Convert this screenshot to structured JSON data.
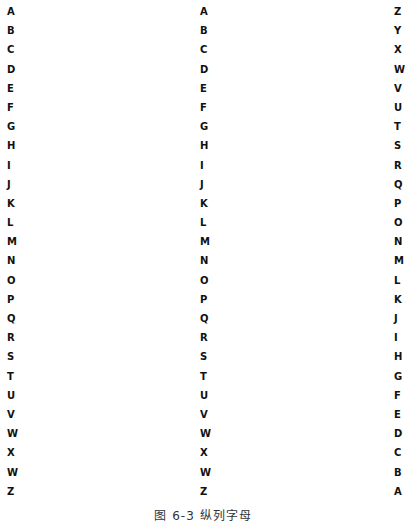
{
  "columns": {
    "left": [
      "A",
      "B",
      "C",
      "D",
      "E",
      "F",
      "G",
      "H",
      "I",
      "J",
      "K",
      "L",
      "M",
      "N",
      "O",
      "P",
      "Q",
      "R",
      "S",
      "T",
      "U",
      "V",
      "W",
      "X",
      "W",
      "Z"
    ],
    "middle": [
      "A",
      "B",
      "C",
      "D",
      "E",
      "F",
      "G",
      "H",
      "I",
      "J",
      "K",
      "L",
      "M",
      "N",
      "O",
      "P",
      "Q",
      "R",
      "S",
      "T",
      "U",
      "V",
      "W",
      "X",
      "W",
      "Z"
    ],
    "right": [
      "Z",
      "Y",
      "X",
      "W",
      "V",
      "U",
      "T",
      "S",
      "R",
      "Q",
      "P",
      "O",
      "N",
      "M",
      "L",
      "K",
      "J",
      "I",
      "H",
      "G",
      "F",
      "E",
      "D",
      "C",
      "B",
      "A"
    ]
  },
  "caption": "图 6-3   纵列字母"
}
